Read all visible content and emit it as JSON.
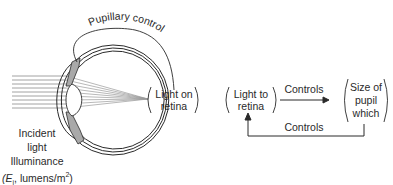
{
  "diagram": {
    "eye": {
      "arc_label": "Pupillary control",
      "retina_label_line1": "Light on",
      "retina_label_line2": "retina",
      "incident_line1": "Incident",
      "incident_line2": "light",
      "incident_line3": "Illuminance",
      "incident_line4_prefix": "(E",
      "incident_line4_sub": "i",
      "incident_line4_mid": ", lumens/m",
      "incident_line4_sup": "2",
      "incident_line4_suffix": ")"
    },
    "feedback_loop": {
      "left_box_line1": "Light to",
      "left_box_line2": "retina",
      "right_box_line1": "Size of",
      "right_box_line2": "pupil",
      "right_box_line3": "which",
      "forward_arrow_label": "Controls",
      "return_arrow_label": "Controls"
    },
    "colors": {
      "line": "#2a2a2a",
      "iris_fill": "#a9a9a9",
      "ray": "#8a8a8a"
    }
  }
}
